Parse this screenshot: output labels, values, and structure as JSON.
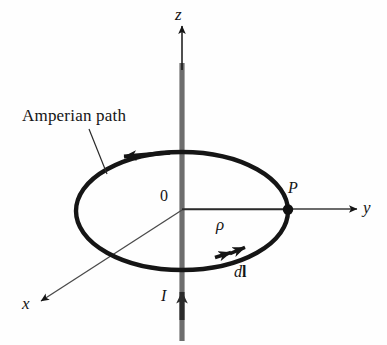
{
  "figure": {
    "background_color": "#fefefe",
    "stroke_color": "#151515",
    "wire_color": "#6e6e6e",
    "labels": {
      "z_axis": "z",
      "y_axis": "y",
      "x_axis": "x",
      "origin": "0",
      "radius": "ρ",
      "point": "P",
      "current": "I",
      "element_d": "d",
      "element_l": "l",
      "amperian_path": "Amperian path"
    },
    "geometry": {
      "origin": [
        182,
        210
      ],
      "ellipse_center": [
        182,
        211
      ],
      "ellipse_rx": 106,
      "ellipse_ry": 59,
      "point_P": [
        288,
        210
      ],
      "z_axis_tip": [
        182,
        22
      ],
      "y_axis_tip": [
        362,
        209
      ],
      "x_axis_tip": [
        37,
        304
      ],
      "wire_top": [
        182,
        63
      ],
      "wire_bottom": [
        182,
        340
      ],
      "current_arrow_tip": [
        182,
        290
      ],
      "path_direction": "counterclockwise-viewed-from-+z",
      "leader_start": [
        90,
        130
      ],
      "leader_end": [
        106,
        173
      ]
    },
    "elements": [
      {
        "name": "z-axis",
        "kind": "arrow-axis"
      },
      {
        "name": "y-axis",
        "kind": "arrow-axis"
      },
      {
        "name": "x-axis",
        "kind": "arrow-axis"
      },
      {
        "name": "wire",
        "kind": "thick-gray-line"
      },
      {
        "name": "current-arrow",
        "kind": "arrowhead-up"
      },
      {
        "name": "amperian-loop",
        "kind": "ellipse"
      },
      {
        "name": "loop-direction-arrow-top",
        "kind": "arrowhead-left"
      },
      {
        "name": "dl-arrow-pair",
        "kind": "arrowhead-double"
      },
      {
        "name": "point-P-marker",
        "kind": "filled-dot"
      },
      {
        "name": "radius-line",
        "kind": "line"
      },
      {
        "name": "leader-line",
        "kind": "line"
      }
    ]
  }
}
